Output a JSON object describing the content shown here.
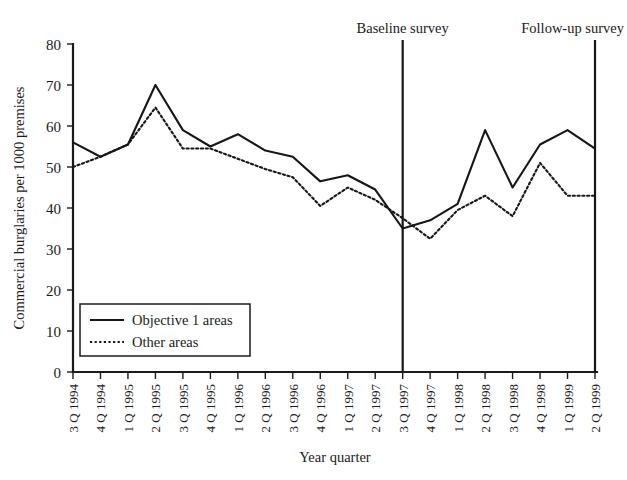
{
  "chart_data": {
    "type": "line",
    "title": "",
    "xlabel": "Year quarter",
    "ylabel": "Commercial burglaries per 1000 premises",
    "ylim": [
      0,
      80
    ],
    "yticks": [
      0,
      10,
      20,
      30,
      40,
      50,
      60,
      70,
      80
    ],
    "grid": false,
    "legend_position": "lower-left-inside",
    "categories": [
      "3 Q 1994",
      "4 Q 1994",
      "1 Q 1995",
      "2 Q 1995",
      "3 Q 1995",
      "4 Q 1995",
      "1 Q 1996",
      "2 Q 1996",
      "3 Q 1996",
      "4 Q 1996",
      "1 Q 1997",
      "2 Q 1997",
      "3 Q 1997",
      "4 Q 1997",
      "1 Q 1998",
      "2 Q 1998",
      "3 Q 1998",
      "4 Q 1998",
      "1 Q 1999",
      "2 Q 1999"
    ],
    "series": [
      {
        "name": "Objective 1 areas",
        "style": "solid",
        "values": [
          56,
          52.5,
          55.5,
          70,
          59,
          55,
          58,
          54,
          52.5,
          46.5,
          48,
          44.5,
          35,
          37,
          41,
          59,
          45,
          55.5,
          59,
          54.5
        ]
      },
      {
        "name": "Other areas",
        "style": "dotted",
        "values": [
          50,
          52.5,
          55.5,
          64.5,
          54.5,
          54.5,
          52,
          49.5,
          47.5,
          40.5,
          45,
          42,
          37.5,
          32.5,
          39.5,
          43,
          38,
          51,
          43,
          43
        ]
      }
    ],
    "annotations": [
      {
        "label": "Baseline survey",
        "at_category": "3 Q 1997"
      },
      {
        "label": "Follow-up survey",
        "at_category": "2 Q 1999"
      }
    ]
  },
  "legend": {
    "items": [
      {
        "label": "Objective 1 areas",
        "style": "solid"
      },
      {
        "label": "Other areas",
        "style": "dotted"
      }
    ]
  },
  "axes": {
    "y_title": "Commercial burglaries per 1000 premises",
    "x_title": "Year quarter",
    "y_tick_labels": [
      "80",
      "70",
      "60",
      "50",
      "40",
      "30",
      "20",
      "10",
      "0"
    ]
  },
  "markers": {
    "baseline": "Baseline survey",
    "followup": "Follow-up survey"
  },
  "colors": {
    "ink": "#161616",
    "background": "#ffffff"
  }
}
